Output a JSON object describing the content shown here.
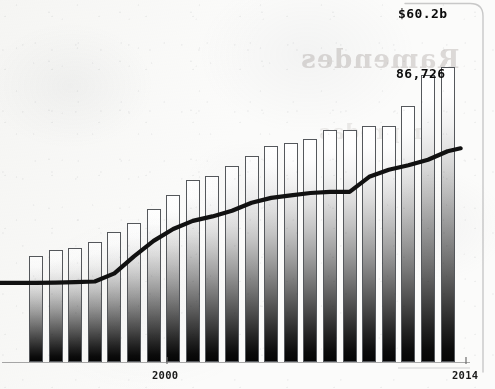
{
  "chart_data": {
    "type": "bar",
    "title": "",
    "subtitle": "",
    "xlabel": "",
    "ylabel": "",
    "grid": false,
    "legend_position": "none",
    "axis": {
      "x_range": [
        1993,
        2014
      ],
      "x_ticks": [
        {
          "label": "2000",
          "value": 2000
        },
        {
          "label": "2014",
          "value": 2014
        }
      ],
      "y_range": [
        0,
        100000
      ]
    },
    "categories": [
      1993,
      1994,
      1995,
      1996,
      1997,
      1998,
      1999,
      2000,
      2001,
      2002,
      2003,
      2004,
      2005,
      2006,
      2007,
      2008,
      2009,
      2010,
      2011,
      2012,
      2013,
      2014
    ],
    "series": [
      {
        "name": "bars",
        "type": "bar",
        "end_label": "86,726",
        "values": [
          30200,
          32000,
          32700,
          34300,
          37100,
          39600,
          43600,
          47600,
          52000,
          53100,
          56000,
          58900,
          61600,
          62600,
          63600,
          66400,
          66400,
          67300,
          67300,
          73100,
          82100,
          84300
        ],
        "end_value": 86726
      },
      {
        "name": "line",
        "type": "line",
        "end_label": "$60.2b",
        "values": [
          22600,
          22700,
          22800,
          23000,
          25300,
          30200,
          34600,
          38000,
          40300,
          41600,
          43200,
          45500,
          46900,
          47600,
          48300,
          48600,
          48600,
          52900,
          54900,
          56200,
          57800,
          60200
        ],
        "end_value": 60200
      }
    ]
  },
  "labels": {
    "line_end": "$60.2b",
    "bar_end": "86,726"
  },
  "ticks": {
    "mid": "2000",
    "right": "2014"
  },
  "ghost": {
    "line1": "Ramendes",
    "line2": "mpredas"
  },
  "colors": {
    "line": "#111111",
    "bar_outline": "#55585c",
    "bar_top": "#ffffff",
    "bar_bottom": "#050505",
    "axis": "#9a9a9a",
    "background": "#fbfbfa",
    "label_text": "#0b0b0b"
  }
}
